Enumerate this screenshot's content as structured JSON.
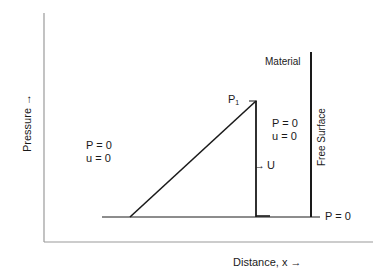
{
  "diagram": {
    "axes": {
      "y_label": "Pressure →",
      "x_label": "Distance, x  →"
    },
    "labels": {
      "material": "Material",
      "free_surface": "Free Surface",
      "peak_pressure_base": "P",
      "peak_pressure_sub": "1",
      "left_region_p": "P = 0",
      "left_region_u": "u = 0",
      "right_region_p": "P = 0",
      "right_region_u": "u = 0",
      "velocity_arrow": "→",
      "velocity_label": "U",
      "baseline_label": "P = 0"
    },
    "colors": {
      "axis": "#9a9a9a",
      "line": "#1a1a1a",
      "background": "#ffffff"
    }
  }
}
